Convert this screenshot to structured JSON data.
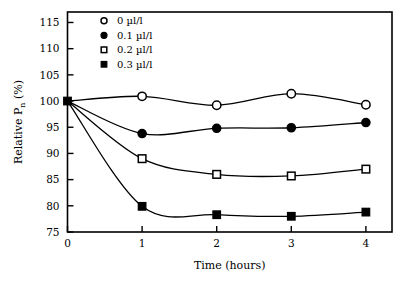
{
  "chart_data": {
    "type": "line",
    "title": "",
    "subtitle": "",
    "xlabel": "Time (hours)",
    "ylabel": "Relative P",
    "ylabel_sub": "n",
    "ylabel_unit": " (%)",
    "x": [
      0,
      1,
      2,
      3,
      4
    ],
    "xlim": [
      0,
      4.35
    ],
    "ylim": [
      75,
      117
    ],
    "xticks": [
      "0",
      "1",
      "2",
      "3",
      "4"
    ],
    "xtick_values": [
      0,
      1,
      2,
      3,
      4
    ],
    "yticks": [
      "75",
      "80",
      "85",
      "90",
      "95",
      "100",
      "105",
      "110",
      "115"
    ],
    "ytick_values": [
      75,
      80,
      85,
      90,
      95,
      100,
      105,
      110,
      115
    ],
    "grid": false,
    "legend_position": "top-left-inside",
    "line_color": "#000000",
    "frame_color": "#000000",
    "background": "#ffffff",
    "series": [
      {
        "name": "0 µl/l",
        "marker": "open-circle",
        "values": [
          100,
          100.9,
          99.2,
          101.4,
          99.3
        ]
      },
      {
        "name": "0.1 µl/l",
        "marker": "filled-circle",
        "values": [
          100,
          93.8,
          94.8,
          94.9,
          95.9
        ]
      },
      {
        "name": "0.2 µl/l",
        "marker": "open-square",
        "values": [
          100,
          89.0,
          86.0,
          85.7,
          87.0
        ]
      },
      {
        "name": "0.3 µl/l",
        "marker": "filled-square",
        "values": [
          100,
          79.9,
          78.3,
          78.0,
          78.8
        ]
      }
    ]
  },
  "legend": {
    "items": [
      {
        "label": "0 µl/l",
        "marker": "open-circle"
      },
      {
        "label": "0.1 µl/l",
        "marker": "filled-circle"
      },
      {
        "label": "0.2 µl/l",
        "marker": "open-square"
      },
      {
        "label": "0.3 µl/l",
        "marker": "filled-square"
      }
    ]
  }
}
